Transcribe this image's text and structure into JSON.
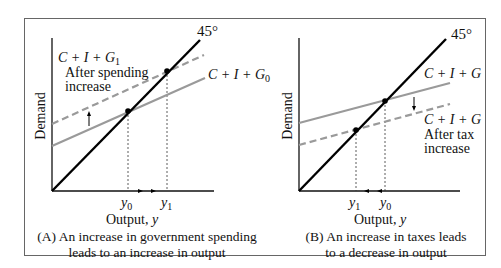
{
  "panels": [
    {
      "id": "A",
      "y_axis_label": "Demand",
      "x_axis_label": "Output, ",
      "x_axis_var": "y",
      "degree_label": "45°",
      "upper_curve_label": "C + I + G",
      "upper_curve_sub": "1",
      "upper_curve_note_line1": "After spending",
      "upper_curve_note_line2": "increase",
      "lower_curve_label": "C + I + G",
      "lower_curve_sub": "0",
      "tick_left": "y",
      "tick_left_sub": "0",
      "tick_right": "y",
      "tick_right_sub": "1",
      "caption_line1": "(A) An increase in government spending",
      "caption_line2": "leads to an increase in output"
    },
    {
      "id": "B",
      "y_axis_label": "Demand",
      "x_axis_label": "Output, ",
      "x_axis_var": "y",
      "degree_label": "45°",
      "upper_curve_label": "C + I + G",
      "lower_curve_label": "C + I + G",
      "lower_curve_note_line1": "After tax",
      "lower_curve_note_line2": "increase",
      "tick_left": "y",
      "tick_left_sub": "1",
      "tick_right": "y",
      "tick_right_sub": "0",
      "caption_line1": "(B) An increase in taxes leads",
      "caption_line2": "to a decrease in output"
    }
  ],
  "colors": {
    "axis": "#111111",
    "line_45": "#000000",
    "ae_line": "#9a9a9a",
    "frame": "#666666"
  }
}
